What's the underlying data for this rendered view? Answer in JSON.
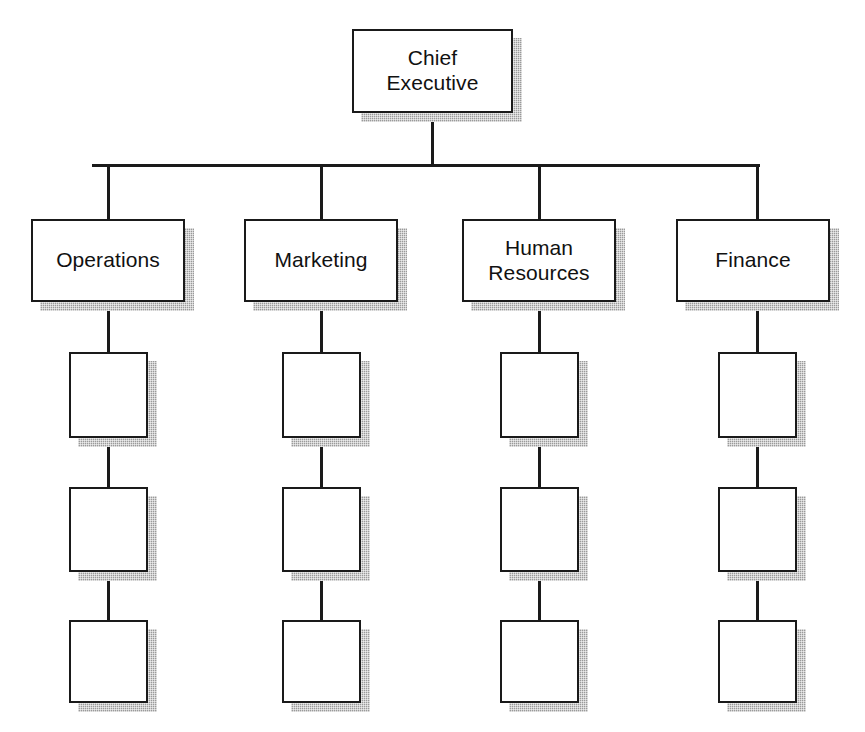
{
  "diagram": {
    "type": "organization-chart",
    "background_color": "#ffffff",
    "line_color": "#1a1a1a",
    "box_fill_color": "#ffffff",
    "box_border_color": "#1a1a1a",
    "shadow_color": "#9a9a9a"
  },
  "root": {
    "label": "Chief\nExecutive",
    "x": 352,
    "y": 29,
    "w": 161,
    "h": 84
  },
  "bus": {
    "y": 165,
    "x_start": 92,
    "x_end": 760,
    "stem_top": 113,
    "drop_bottom": 219
  },
  "departments": [
    {
      "label": "Operations",
      "x": 31,
      "y": 219,
      "w": 154,
      "h": 83,
      "center_x": 108
    },
    {
      "label": "Marketing",
      "x": 244,
      "y": 219,
      "w": 154,
      "h": 83,
      "center_x": 321
    },
    {
      "label": "Human\nResources",
      "x": 462,
      "y": 219,
      "w": 154,
      "h": 83,
      "center_x": 539
    },
    {
      "label": "Finance",
      "x": 676,
      "y": 219,
      "w": 154,
      "h": 83,
      "center_x": 757
    }
  ],
  "subordinate_rows": [
    {
      "y": 352,
      "h": 86
    },
    {
      "y": 487,
      "h": 85
    },
    {
      "y": 620,
      "h": 83
    }
  ],
  "subordinate_box": {
    "label": "",
    "w": 79
  },
  "subordinates": [
    {
      "column": "Operations",
      "center_x": 108,
      "boxes": [
        "",
        "",
        ""
      ]
    },
    {
      "column": "Marketing",
      "center_x": 321,
      "boxes": [
        "",
        "",
        ""
      ]
    },
    {
      "column": "Human Resources",
      "center_x": 539,
      "boxes": [
        "",
        "",
        ""
      ]
    },
    {
      "column": "Finance",
      "center_x": 757,
      "boxes": [
        "",
        "",
        ""
      ]
    }
  ]
}
